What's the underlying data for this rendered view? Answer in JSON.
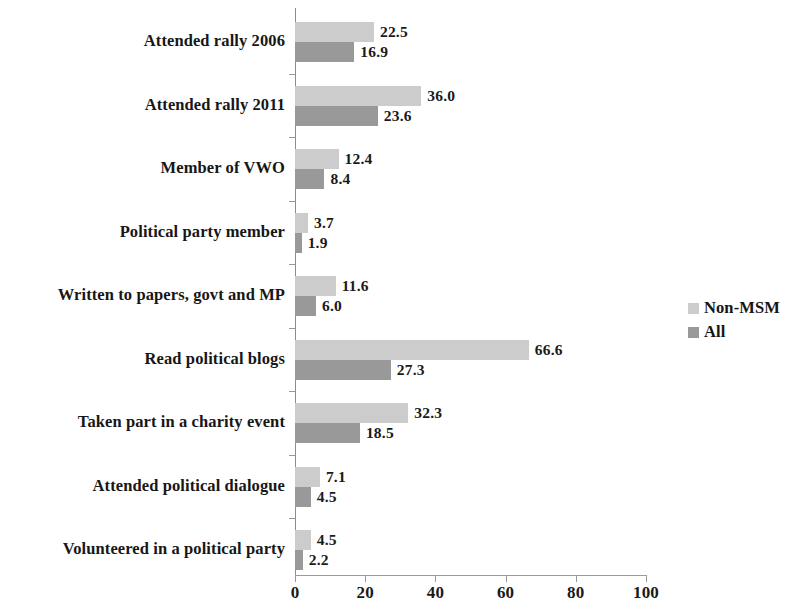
{
  "chart_data": {
    "type": "bar",
    "orientation": "horizontal",
    "title": "",
    "subtitle": "",
    "xlabel": "",
    "ylabel": "",
    "xlim": [
      0,
      100
    ],
    "xticks": [
      0,
      20,
      40,
      60,
      80,
      100
    ],
    "xtick_labels": [
      "0",
      "20",
      "40",
      "60",
      "80",
      "100"
    ],
    "grid": false,
    "legend_position": "right",
    "categories": [
      "Attended rally 2006",
      "Attended rally 2011",
      "Member of VWO",
      "Political party member",
      "Written to papers, govt and MP",
      "Read political blogs",
      "Taken part in a charity event",
      "Attended political dialogue",
      "Volunteered in a political party"
    ],
    "series": [
      {
        "name": "Non-MSM",
        "color": "#cccccc",
        "values": [
          22.5,
          36.0,
          12.4,
          3.7,
          11.6,
          66.6,
          32.3,
          7.1,
          4.5
        ],
        "labels": [
          "22.5",
          "36.0",
          "12.4",
          "3.7",
          "11.6",
          "66.6",
          "32.3",
          "7.1",
          "4.5"
        ]
      },
      {
        "name": "All",
        "color": "#999999",
        "values": [
          16.9,
          23.6,
          8.4,
          1.9,
          6.0,
          27.3,
          18.5,
          4.5,
          2.2
        ],
        "labels": [
          "16.9",
          "23.6",
          "8.4",
          "1.9",
          "6.0",
          "27.3",
          "18.5",
          "4.5",
          "2.2"
        ]
      }
    ]
  },
  "legend": {
    "items": [
      {
        "label": "Non-MSM",
        "color": "#cccccc"
      },
      {
        "label": "All",
        "color": "#999999"
      }
    ]
  },
  "colors": {
    "non_msm": "#cccccc",
    "all": "#999999",
    "axis": "#9a9a9a",
    "text": "#1a1a1a",
    "background": "#ffffff"
  }
}
